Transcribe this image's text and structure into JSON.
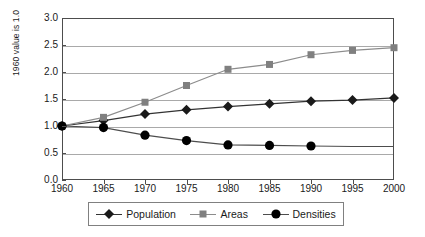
{
  "chart_data": {
    "type": "line",
    "title": "",
    "subtitle": "",
    "xlabel": "",
    "ylabel": "1960 value is 1.0",
    "x": [
      1960,
      1965,
      1970,
      1975,
      1980,
      1985,
      1990,
      1995,
      2000
    ],
    "x_tick_labels": [
      "1960",
      "1965",
      "1970",
      "1975",
      "1980",
      "1985",
      "1990",
      "1995",
      "2000"
    ],
    "xlim": [
      1960,
      2000
    ],
    "ylim": [
      0.0,
      3.0
    ],
    "y_ticks": [
      0.0,
      0.5,
      1.0,
      1.5,
      2.0,
      2.5,
      3.0
    ],
    "y_tick_labels": [
      "0.0",
      "0.5",
      "1.0",
      "1.5",
      "2.0",
      "2.5",
      "3.0"
    ],
    "grid": "horizontal",
    "legend_position": "bottom",
    "series": [
      {
        "name": "Population",
        "marker": "diamond",
        "color": "#1a1a1a",
        "line_color": "#333333",
        "values": [
          1.0,
          1.1,
          1.22,
          1.3,
          1.36,
          1.41,
          1.46,
          1.48,
          1.52
        ]
      },
      {
        "name": "Areas",
        "marker": "square",
        "color": "#808080",
        "line_color": "#8c8c8c",
        "values": [
          1.0,
          1.16,
          1.44,
          1.75,
          2.05,
          2.14,
          2.32,
          2.4,
          2.45
        ]
      },
      {
        "name": "Densities",
        "marker": "circle",
        "color": "#000000",
        "line_color": "#4d4d4d",
        "values": [
          1.0,
          0.97,
          0.83,
          0.73,
          0.65,
          0.64,
          0.63,
          0.62,
          0.62
        ],
        "marker_last_index": 6
      }
    ]
  },
  "legend": {
    "entries": [
      {
        "label": "Population"
      },
      {
        "label": "Areas"
      },
      {
        "label": "Densities"
      }
    ]
  },
  "colors": {
    "axis": "#4d4d4d",
    "grid": "#a9a9a9",
    "text": "#1a1a1a",
    "background": "#ffffff",
    "population": "#1a1a1a",
    "areas": "#808080",
    "densities": "#000000"
  }
}
